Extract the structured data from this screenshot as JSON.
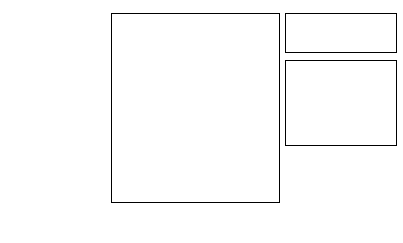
{
  "chart_data": {
    "type": "bar",
    "orientation": "horizontal",
    "title": "",
    "xlabel": "",
    "ylabel": "",
    "xlim": [
      0,
      50
    ],
    "xticks": [
      0,
      10,
      20,
      30,
      40,
      50
    ],
    "xtick_labels": [
      "0",
      "10",
      "20",
      "30",
      "40",
      "50"
    ],
    "grid": false,
    "legend_position": "top-right",
    "categories": [
      "Single Function",
      "Permanent NP Staff",
      "SBU Manager",
      "Process Owners",
      "NP Committee",
      "Venture Group",
      "Other"
    ],
    "series": [
      {
        "name": "% Mentions",
        "color": "#1a1a1a",
        "values": [
          43,
          27,
          28,
          28,
          29,
          6.5,
          13
        ]
      },
      {
        "name": "% Most Frequent",
        "color": "#cccccc",
        "values": [
          30,
          12,
          17,
          8.5,
          25,
          2,
          11
        ]
      }
    ],
    "annotations": [
      {
        "text": "For Single",
        "indent": false
      },
      {
        "text": "Function:",
        "indent": false
      },
      {
        "text": "25% R&D",
        "indent": false
      },
      {
        "text": "49% Engineering",
        "indent": false
      },
      {
        "text": "14% Marketing",
        "indent": false
      },
      {
        "text": "3% Planning",
        "indent": true
      }
    ]
  },
  "legend": {
    "entries": [
      {
        "label": "% Mentions",
        "swatch": "mentions"
      },
      {
        "label": "% Most Frequent",
        "swatch": "most-frequent"
      }
    ]
  },
  "colors": {
    "mentions": "#1a1a1a",
    "most_frequent": "#cccccc",
    "axis": "#000000",
    "background": "#ffffff"
  }
}
